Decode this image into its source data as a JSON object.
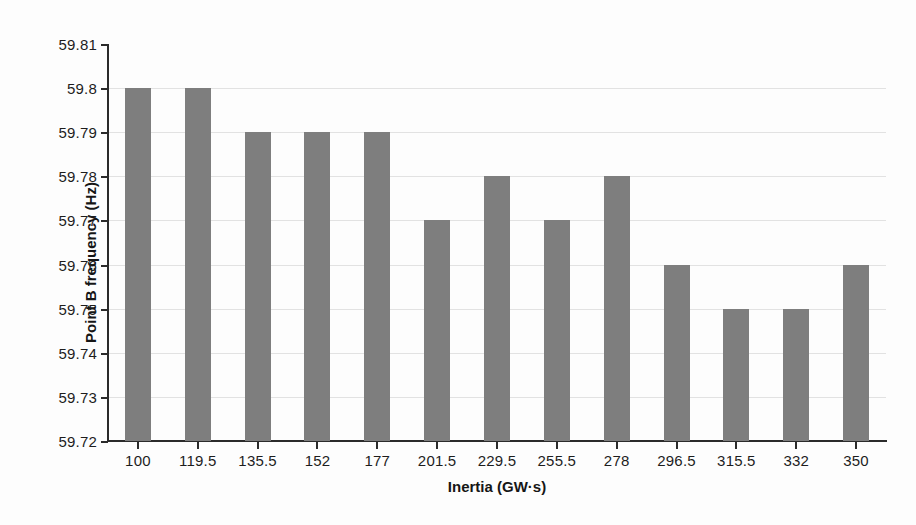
{
  "chart_data": {
    "type": "bar",
    "title": "",
    "xlabel": "Inertia (GW·s)",
    "ylabel": "Point B frequency (Hz)",
    "categories": [
      "100",
      "119.5",
      "135.5",
      "152",
      "177",
      "201.5",
      "229.5",
      "255.5",
      "278",
      "296.5",
      "315.5",
      "332",
      "350"
    ],
    "values": [
      59.8,
      59.8,
      59.79,
      59.79,
      59.79,
      59.77,
      59.78,
      59.77,
      59.78,
      59.76,
      59.75,
      59.75,
      59.76
    ],
    "ylim": [
      59.72,
      59.81
    ],
    "ytick_labels": [
      "59.81",
      "59.8",
      "59.79",
      "59.78",
      "59.77",
      "59.76",
      "59.75",
      "59.74",
      "59.73",
      "59.72"
    ],
    "ytick_values": [
      59.81,
      59.8,
      59.79,
      59.78,
      59.77,
      59.76,
      59.75,
      59.74,
      59.73,
      59.72
    ],
    "grid": true,
    "legend": "none",
    "series_color": "#7e7e7e",
    "axis_color": "#2b2b2b",
    "gridline_color": "#e2e2e2",
    "background_color": "#fdfdfd"
  }
}
